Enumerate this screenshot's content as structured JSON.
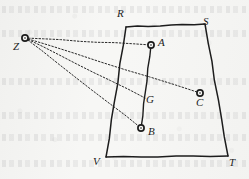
{
  "figure": {
    "type": "geometry-diagram",
    "width": 249,
    "height": 179,
    "ink_color": "#1d1d1d",
    "paper_color": "#f7f7f5"
  },
  "labels": {
    "R": "R",
    "S": "S",
    "T": "T",
    "V": "V",
    "Z": "Z",
    "A": "A",
    "B": "B",
    "C": "C",
    "G": "G"
  },
  "points": {
    "R": {
      "x": 126,
      "y": 27,
      "label_x": 117,
      "label_y": 8,
      "marker": false
    },
    "S": {
      "x": 205,
      "y": 24,
      "label_x": 203,
      "label_y": 16,
      "marker": false
    },
    "T": {
      "x": 228,
      "y": 156,
      "label_x": 229,
      "label_y": 157,
      "marker": false
    },
    "V": {
      "x": 106,
      "y": 157,
      "label_x": 93,
      "label_y": 156,
      "marker": false
    },
    "Z": {
      "x": 25,
      "y": 38,
      "label_x": 13,
      "label_y": 41,
      "marker": true
    },
    "A": {
      "x": 151,
      "y": 45,
      "label_x": 158,
      "label_y": 37,
      "marker": true
    },
    "B": {
      "x": 141,
      "y": 128,
      "label_x": 148,
      "label_y": 126,
      "marker": true
    },
    "C": {
      "x": 200,
      "y": 93,
      "label_x": 196,
      "label_y": 97,
      "marker": true
    },
    "G": {
      "x": 145,
      "y": 98,
      "label_x": 146,
      "label_y": 94,
      "marker": false
    }
  },
  "edges": [
    {
      "name": "side-RS",
      "from": "R",
      "to": "S",
      "style": "solid"
    },
    {
      "name": "side-ST",
      "from": "S",
      "to": "T",
      "style": "solid"
    },
    {
      "name": "side-TV",
      "from": "T",
      "to": "V",
      "style": "solid"
    },
    {
      "name": "side-VR",
      "from": "V",
      "to": "R",
      "style": "solid"
    },
    {
      "name": "segment-AB",
      "from": "A",
      "to": "B",
      "style": "solid"
    }
  ],
  "rays_from_Z": [
    {
      "name": "ray-ZA",
      "from": "Z",
      "to": "A",
      "style": "dotted"
    },
    {
      "name": "ray-ZC",
      "from": "Z",
      "to": "C",
      "style": "dotted"
    },
    {
      "name": "ray-ZG",
      "from": "Z",
      "to": "G",
      "style": "dotted"
    },
    {
      "name": "ray-ZB",
      "from": "Z",
      "to": "B",
      "style": "dotted"
    }
  ]
}
